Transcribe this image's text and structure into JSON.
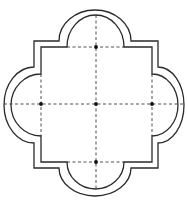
{
  "diagram": {
    "type": "quatrefoil-plan",
    "colors": {
      "line": "#2a2a2a",
      "axis": "#3a3a3a",
      "dot": "#111111",
      "background": "#ffffff"
    },
    "outer_wall": {
      "square": {
        "left": 34,
        "top": 41,
        "right": 158,
        "bottom": 168
      },
      "lobes": {
        "top": {
          "from_x": 59,
          "to_x": 131,
          "apex_y": 10
        },
        "bottom": {
          "from_x": 59,
          "to_x": 131,
          "apex_y": 196
        },
        "left": {
          "from_y": 67,
          "to_y": 143,
          "apex_x": 4
        },
        "right": {
          "from_y": 67,
          "to_y": 143,
          "apex_x": 184
        }
      }
    },
    "inner_wall": {
      "square": {
        "left": 41,
        "top": 47,
        "right": 152,
        "bottom": 162
      },
      "lobes": {
        "top": {
          "from_x": 67,
          "to_x": 124,
          "apex_y": 15
        },
        "bottom": {
          "from_x": 67,
          "to_x": 124,
          "apex_y": 189
        },
        "left": {
          "from_y": 74,
          "to_y": 136,
          "apex_x": 11
        },
        "right": {
          "from_y": 74,
          "to_y": 136,
          "apex_x": 178
        }
      }
    },
    "axes": {
      "vertical": {
        "x": 96,
        "y1": 15,
        "y2": 189
      },
      "horizontal": {
        "y": 104,
        "x1": 4,
        "x2": 184
      },
      "top_chord": {
        "y": 47,
        "x1": 67,
        "x2": 124
      },
      "bottom_chord": {
        "y": 162,
        "x1": 67,
        "x2": 124
      },
      "left_chord": {
        "x": 41,
        "y1": 74,
        "y2": 136
      },
      "right_chord": {
        "x": 152,
        "y1": 74,
        "y2": 136
      }
    },
    "center_points": [
      {
        "name": "top",
        "x": 96,
        "y": 47
      },
      {
        "name": "left",
        "x": 41,
        "y": 104
      },
      {
        "name": "center",
        "x": 96,
        "y": 104
      },
      {
        "name": "right",
        "x": 152,
        "y": 104
      },
      {
        "name": "bottom",
        "x": 96,
        "y": 162
      }
    ],
    "dot_radius": 1.9
  }
}
